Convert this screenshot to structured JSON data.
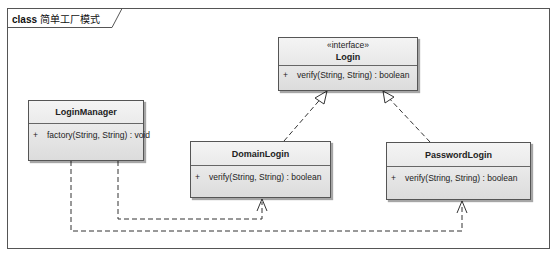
{
  "frame": {
    "kind": "class",
    "title": "简单工厂模式"
  },
  "classes": {
    "login": {
      "stereotype": "«interface»",
      "name": "Login",
      "operations": [
        {
          "visibility": "+",
          "signature": "verify(String, String) : boolean"
        }
      ]
    },
    "login_manager": {
      "name": "LoginManager",
      "operations": [
        {
          "visibility": "+",
          "signature": "factory(String, String) : void"
        }
      ]
    },
    "domain_login": {
      "name": "DomainLogin",
      "operations": [
        {
          "visibility": "+",
          "signature": "verify(String, String) : boolean"
        }
      ]
    },
    "password_login": {
      "name": "PasswordLogin",
      "operations": [
        {
          "visibility": "+",
          "signature": "verify(String, String) : boolean"
        }
      ]
    }
  },
  "relationships": [
    {
      "type": "realization",
      "from": "DomainLogin",
      "to": "Login"
    },
    {
      "type": "realization",
      "from": "PasswordLogin",
      "to": "Login"
    },
    {
      "type": "dependency",
      "from": "LoginManager",
      "to": "DomainLogin"
    },
    {
      "type": "dependency",
      "from": "LoginManager",
      "to": "PasswordLogin"
    }
  ],
  "colors": {
    "border": "#555555",
    "fill_top": "#f4f4f4",
    "fill_bottom": "#dcdcdc"
  }
}
